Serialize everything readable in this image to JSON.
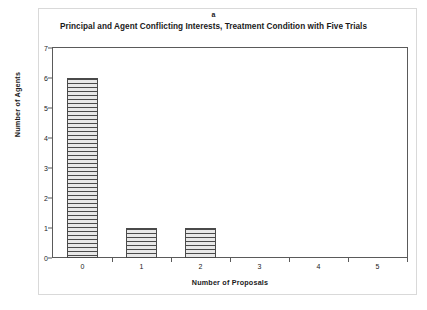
{
  "figure": {
    "panel_letter": "a",
    "background_color": "#ffffff",
    "frame_color": "#5a5a5a"
  },
  "chart_data": {
    "type": "bar",
    "title": "Principal and Agent Conflicting Interests, Treatment Condition with Five Trials",
    "panel_label": "a",
    "categories": [
      "0",
      "1",
      "2",
      "3",
      "4",
      "5"
    ],
    "values": [
      6,
      1,
      1,
      0,
      0,
      0
    ],
    "xlabel": "Number of Proposals",
    "ylabel": "Number of Agents",
    "ylim": [
      0,
      7
    ],
    "yticks": [
      "0",
      "1",
      "2",
      "3",
      "4",
      "5",
      "6",
      "7"
    ],
    "ytick_values": [
      0,
      1,
      2,
      3,
      4,
      5,
      6,
      7
    ],
    "xtick_labels": [
      "0",
      "1",
      "2",
      "3",
      "4",
      "5"
    ],
    "grid": false,
    "legend": null,
    "bar_fill": "horizontal-line-hatch",
    "bar_fill_color": "#e8e8e8",
    "bar_edge_color": "#4a4a4a"
  }
}
